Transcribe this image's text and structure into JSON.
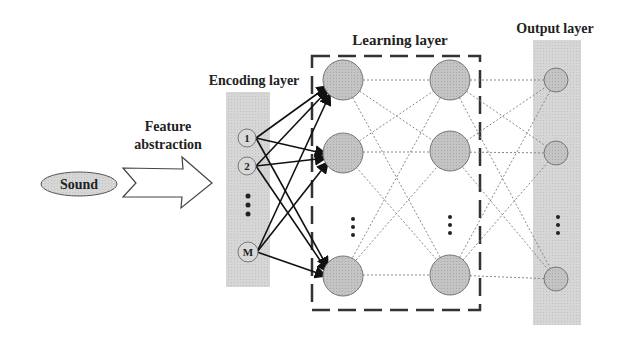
{
  "labels": {
    "input": "Sound",
    "arrow_line1": "Feature",
    "arrow_line2": "abstraction",
    "encoding": "Encoding layer",
    "learning": "Learning layer",
    "output": "Output layer"
  },
  "encoding_nodes": [
    "1",
    "2",
    "M"
  ],
  "ellipsis": "⋮",
  "colors": {
    "band": "#d9d9d9",
    "node_fill": "#bdbdbd",
    "node_stroke": "#666666",
    "arrow": "#111111",
    "dotted": "#888888"
  }
}
